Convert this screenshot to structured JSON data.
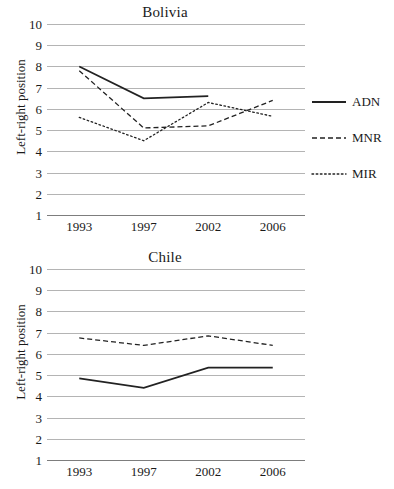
{
  "figure": {
    "yaxis_label": "Left-right position",
    "y_ticks": [
      10,
      9,
      8,
      7,
      6,
      5,
      4,
      3,
      2,
      1
    ],
    "x_ticks": [
      "1993",
      "1997",
      "2002",
      "2006"
    ],
    "line_color": "#222222",
    "gridline_color": "#b4b4b4"
  },
  "panels": [
    {
      "title": "Bolivia",
      "legend": [
        {
          "label": "ADN",
          "style": "solid"
        },
        {
          "label": "MNR",
          "style": "dashed"
        },
        {
          "label": "MIR",
          "style": "dotted"
        }
      ]
    },
    {
      "title": "Chile",
      "legend": [
        {
          "label": "DC",
          "style": "solid"
        },
        {
          "label": "RN",
          "style": "dashed"
        }
      ]
    }
  ],
  "chart_data": [
    {
      "type": "line",
      "title": "Bolivia",
      "xlabel": "",
      "ylabel": "Left-right position",
      "x": [
        1993,
        1997,
        2002,
        2006
      ],
      "xlim": [
        1993,
        2006
      ],
      "ylim": [
        1,
        10
      ],
      "ytick_step": 1,
      "grid": true,
      "legend_position": "right",
      "series": [
        {
          "name": "ADN",
          "style": "solid",
          "x": [
            1993,
            1997,
            2002
          ],
          "values": [
            8.0,
            6.5,
            6.6
          ]
        },
        {
          "name": "MNR",
          "style": "dashed",
          "x": [
            1993,
            1997,
            2002,
            2006
          ],
          "values": [
            7.8,
            5.1,
            5.2,
            6.4
          ]
        },
        {
          "name": "MIR",
          "style": "dotted",
          "x": [
            1993,
            1997,
            2002,
            2006
          ],
          "values": [
            5.6,
            4.5,
            6.3,
            5.65
          ]
        }
      ]
    },
    {
      "type": "line",
      "title": "Chile",
      "xlabel": "",
      "ylabel": "Left-right position",
      "x": [
        1993,
        1997,
        2002,
        2006
      ],
      "xlim": [
        1993,
        2006
      ],
      "ylim": [
        1,
        10
      ],
      "ytick_step": 1,
      "grid": true,
      "legend_position": "right",
      "series": [
        {
          "name": "DC",
          "style": "solid",
          "x": [
            1993,
            1997,
            2002,
            2006
          ],
          "values": [
            4.85,
            4.4,
            5.35,
            5.35
          ]
        },
        {
          "name": "RN",
          "style": "dashed",
          "x": [
            1993,
            1997,
            2002,
            2006
          ],
          "values": [
            6.75,
            6.4,
            6.85,
            6.4
          ]
        }
      ]
    }
  ]
}
